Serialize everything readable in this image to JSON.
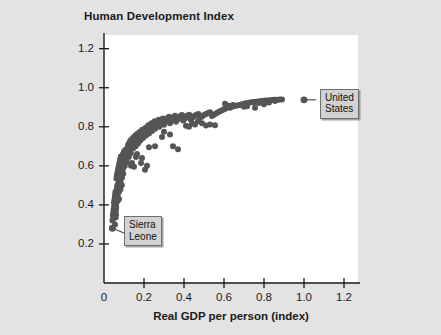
{
  "chart_data": {
    "type": "scatter",
    "title": "Human Development Index",
    "xlabel": "Real GDP per person (index)",
    "ylabel": "",
    "xlim": [
      0,
      1.27
    ],
    "ylim": [
      0,
      1.27
    ],
    "xticks": [
      "0",
      "0.2",
      "0.4",
      "0.6",
      "0.8",
      "1.0",
      "1.2"
    ],
    "xtick_values": [
      0,
      0.2,
      0.4,
      0.6,
      0.8,
      1.0,
      1.2
    ],
    "yticks": [
      "0.2",
      "0.4",
      "0.6",
      "0.8",
      "1.0",
      "1.2"
    ],
    "ytick_values": [
      0.2,
      0.4,
      0.6,
      0.8,
      1.0,
      1.2
    ],
    "grid": false,
    "legend": "none",
    "marker_color": "#555555",
    "marker_size": 6,
    "plot_background": "#ffffff",
    "figure_background": "#e3e3e3",
    "points": [
      [
        0.04,
        0.28
      ],
      [
        0.042,
        0.32
      ],
      [
        0.044,
        0.345
      ],
      [
        0.046,
        0.36
      ],
      [
        0.048,
        0.375
      ],
      [
        0.05,
        0.39
      ],
      [
        0.05,
        0.41
      ],
      [
        0.052,
        0.42
      ],
      [
        0.053,
        0.43
      ],
      [
        0.055,
        0.44
      ],
      [
        0.056,
        0.45
      ],
      [
        0.057,
        0.46
      ],
      [
        0.058,
        0.468
      ],
      [
        0.06,
        0.35
      ],
      [
        0.06,
        0.395
      ],
      [
        0.061,
        0.415
      ],
      [
        0.062,
        0.44
      ],
      [
        0.063,
        0.455
      ],
      [
        0.064,
        0.47
      ],
      [
        0.065,
        0.48
      ],
      [
        0.066,
        0.49
      ],
      [
        0.067,
        0.5
      ],
      [
        0.068,
        0.42
      ],
      [
        0.069,
        0.455
      ],
      [
        0.07,
        0.475
      ],
      [
        0.071,
        0.495
      ],
      [
        0.072,
        0.505
      ],
      [
        0.073,
        0.515
      ],
      [
        0.074,
        0.525
      ],
      [
        0.075,
        0.43
      ],
      [
        0.076,
        0.47
      ],
      [
        0.077,
        0.5
      ],
      [
        0.078,
        0.52
      ],
      [
        0.079,
        0.535
      ],
      [
        0.08,
        0.545
      ],
      [
        0.081,
        0.555
      ],
      [
        0.082,
        0.48
      ],
      [
        0.083,
        0.51
      ],
      [
        0.084,
        0.53
      ],
      [
        0.085,
        0.55
      ],
      [
        0.086,
        0.565
      ],
      [
        0.087,
        0.575
      ],
      [
        0.088,
        0.585
      ],
      [
        0.089,
        0.5
      ],
      [
        0.09,
        0.54
      ],
      [
        0.091,
        0.56
      ],
      [
        0.092,
        0.58
      ],
      [
        0.093,
        0.595
      ],
      [
        0.094,
        0.605
      ],
      [
        0.095,
        0.615
      ],
      [
        0.096,
        0.56
      ],
      [
        0.097,
        0.59
      ],
      [
        0.098,
        0.61
      ],
      [
        0.1,
        0.625
      ],
      [
        0.101,
        0.64
      ],
      [
        0.102,
        0.655
      ],
      [
        0.104,
        0.6
      ],
      [
        0.105,
        0.63
      ],
      [
        0.106,
        0.65
      ],
      [
        0.108,
        0.665
      ],
      [
        0.11,
        0.675
      ],
      [
        0.112,
        0.685
      ],
      [
        0.114,
        0.62
      ],
      [
        0.115,
        0.655
      ],
      [
        0.116,
        0.672
      ],
      [
        0.118,
        0.69
      ],
      [
        0.12,
        0.7
      ],
      [
        0.122,
        0.71
      ],
      [
        0.124,
        0.645
      ],
      [
        0.125,
        0.68
      ],
      [
        0.126,
        0.7
      ],
      [
        0.128,
        0.715
      ],
      [
        0.13,
        0.722
      ],
      [
        0.132,
        0.73
      ],
      [
        0.134,
        0.665
      ],
      [
        0.136,
        0.695
      ],
      [
        0.138,
        0.712
      ],
      [
        0.14,
        0.725
      ],
      [
        0.142,
        0.735
      ],
      [
        0.144,
        0.742
      ],
      [
        0.146,
        0.69
      ],
      [
        0.148,
        0.715
      ],
      [
        0.15,
        0.73
      ],
      [
        0.152,
        0.74
      ],
      [
        0.154,
        0.748
      ],
      [
        0.156,
        0.755
      ],
      [
        0.158,
        0.7
      ],
      [
        0.16,
        0.725
      ],
      [
        0.162,
        0.74
      ],
      [
        0.164,
        0.75
      ],
      [
        0.166,
        0.758
      ],
      [
        0.168,
        0.765
      ],
      [
        0.17,
        0.715
      ],
      [
        0.172,
        0.738
      ],
      [
        0.174,
        0.752
      ],
      [
        0.176,
        0.762
      ],
      [
        0.178,
        0.77
      ],
      [
        0.18,
        0.775
      ],
      [
        0.182,
        0.73
      ],
      [
        0.184,
        0.748
      ],
      [
        0.186,
        0.76
      ],
      [
        0.188,
        0.77
      ],
      [
        0.19,
        0.778
      ],
      [
        0.192,
        0.785
      ],
      [
        0.195,
        0.742
      ],
      [
        0.198,
        0.758
      ],
      [
        0.2,
        0.77
      ],
      [
        0.202,
        0.78
      ],
      [
        0.205,
        0.788
      ],
      [
        0.208,
        0.795
      ],
      [
        0.21,
        0.755
      ],
      [
        0.212,
        0.772
      ],
      [
        0.215,
        0.782
      ],
      [
        0.218,
        0.792
      ],
      [
        0.22,
        0.8
      ],
      [
        0.222,
        0.808
      ],
      [
        0.225,
        0.765
      ],
      [
        0.228,
        0.782
      ],
      [
        0.23,
        0.795
      ],
      [
        0.232,
        0.805
      ],
      [
        0.235,
        0.812
      ],
      [
        0.238,
        0.818
      ],
      [
        0.24,
        0.778
      ],
      [
        0.243,
        0.792
      ],
      [
        0.245,
        0.802
      ],
      [
        0.248,
        0.812
      ],
      [
        0.25,
        0.82
      ],
      [
        0.253,
        0.828
      ],
      [
        0.256,
        0.79
      ],
      [
        0.26,
        0.805
      ],
      [
        0.263,
        0.815
      ],
      [
        0.266,
        0.822
      ],
      [
        0.27,
        0.83
      ],
      [
        0.273,
        0.836
      ],
      [
        0.276,
        0.8
      ],
      [
        0.28,
        0.812
      ],
      [
        0.283,
        0.822
      ],
      [
        0.287,
        0.83
      ],
      [
        0.29,
        0.838
      ],
      [
        0.295,
        0.843
      ],
      [
        0.3,
        0.81
      ],
      [
        0.305,
        0.822
      ],
      [
        0.31,
        0.832
      ],
      [
        0.315,
        0.84
      ],
      [
        0.32,
        0.846
      ],
      [
        0.325,
        0.851
      ],
      [
        0.33,
        0.818
      ],
      [
        0.335,
        0.83
      ],
      [
        0.34,
        0.838
      ],
      [
        0.345,
        0.845
      ],
      [
        0.35,
        0.851
      ],
      [
        0.355,
        0.856
      ],
      [
        0.36,
        0.826
      ],
      [
        0.366,
        0.836
      ],
      [
        0.372,
        0.843
      ],
      [
        0.378,
        0.85
      ],
      [
        0.384,
        0.856
      ],
      [
        0.39,
        0.86
      ],
      [
        0.396,
        0.832
      ],
      [
        0.402,
        0.841
      ],
      [
        0.408,
        0.848
      ],
      [
        0.414,
        0.854
      ],
      [
        0.42,
        0.858
      ],
      [
        0.426,
        0.862
      ],
      [
        0.432,
        0.838
      ],
      [
        0.44,
        0.845
      ],
      [
        0.448,
        0.852
      ],
      [
        0.456,
        0.858
      ],
      [
        0.464,
        0.862
      ],
      [
        0.472,
        0.866
      ],
      [
        0.48,
        0.846
      ],
      [
        0.49,
        0.853
      ],
      [
        0.5,
        0.86
      ],
      [
        0.51,
        0.866
      ],
      [
        0.52,
        0.87
      ],
      [
        0.53,
        0.874
      ],
      [
        0.54,
        0.855
      ],
      [
        0.55,
        0.862
      ],
      [
        0.56,
        0.868
      ],
      [
        0.57,
        0.875
      ],
      [
        0.58,
        0.88
      ],
      [
        0.59,
        0.885
      ],
      [
        0.6,
        0.89
      ],
      [
        0.61,
        0.895
      ],
      [
        0.62,
        0.9
      ],
      [
        0.63,
        0.898
      ],
      [
        0.64,
        0.903
      ],
      [
        0.65,
        0.906
      ],
      [
        0.66,
        0.908
      ],
      [
        0.67,
        0.91
      ],
      [
        0.68,
        0.912
      ],
      [
        0.69,
        0.915
      ],
      [
        0.7,
        0.918
      ],
      [
        0.71,
        0.92
      ],
      [
        0.72,
        0.922
      ],
      [
        0.73,
        0.924
      ],
      [
        0.74,
        0.925
      ],
      [
        0.75,
        0.927
      ],
      [
        0.76,
        0.928
      ],
      [
        0.77,
        0.93
      ],
      [
        0.78,
        0.931
      ],
      [
        0.79,
        0.932
      ],
      [
        0.8,
        0.933
      ],
      [
        0.81,
        0.934
      ],
      [
        0.82,
        0.935
      ],
      [
        0.83,
        0.936
      ],
      [
        0.84,
        0.937
      ],
      [
        0.85,
        0.938
      ],
      [
        0.86,
        0.938
      ],
      [
        0.87,
        0.939
      ],
      [
        0.88,
        0.94
      ],
      [
        0.89,
        0.94
      ],
      [
        0.135,
        0.6
      ],
      [
        0.14,
        0.615
      ],
      [
        0.15,
        0.595
      ],
      [
        0.16,
        0.645
      ],
      [
        0.165,
        0.66
      ],
      [
        0.185,
        0.615
      ],
      [
        0.19,
        0.64
      ],
      [
        0.205,
        0.58
      ],
      [
        0.215,
        0.6
      ],
      [
        0.225,
        0.695
      ],
      [
        0.255,
        0.7
      ],
      [
        0.29,
        0.748
      ],
      [
        0.3,
        0.775
      ],
      [
        0.33,
        0.76
      ],
      [
        0.345,
        0.7
      ],
      [
        0.37,
        0.685
      ],
      [
        0.395,
        0.855
      ],
      [
        0.41,
        0.805
      ],
      [
        0.425,
        0.8
      ],
      [
        0.44,
        0.818
      ],
      [
        0.455,
        0.812
      ],
      [
        0.47,
        0.828
      ],
      [
        0.49,
        0.818
      ],
      [
        0.51,
        0.806
      ],
      [
        0.53,
        0.812
      ],
      [
        0.555,
        0.808
      ],
      [
        0.605,
        0.918
      ],
      [
        0.625,
        0.908
      ],
      [
        0.645,
        0.912
      ],
      [
        0.7,
        0.902
      ],
      [
        0.715,
        0.905
      ],
      [
        0.755,
        0.898
      ],
      [
        0.775,
        0.922
      ],
      [
        0.8,
        0.915
      ],
      [
        0.825,
        0.924
      ],
      [
        0.855,
        0.932
      ],
      [
        0.095,
        0.66
      ],
      [
        0.1,
        0.672
      ],
      [
        0.105,
        0.68
      ],
      [
        0.11,
        0.665
      ],
      [
        0.118,
        0.655
      ],
      [
        0.122,
        0.672
      ],
      [
        0.128,
        0.682
      ],
      [
        0.133,
        0.69
      ],
      [
        0.138,
        0.698
      ],
      [
        0.143,
        0.705
      ],
      [
        0.148,
        0.7
      ],
      [
        0.153,
        0.708
      ],
      [
        0.062,
        0.535
      ],
      [
        0.064,
        0.548
      ],
      [
        0.066,
        0.558
      ],
      [
        0.068,
        0.568
      ],
      [
        0.07,
        0.578
      ],
      [
        0.072,
        0.588
      ],
      [
        0.074,
        0.598
      ],
      [
        0.076,
        0.608
      ],
      [
        0.078,
        0.618
      ],
      [
        0.08,
        0.628
      ],
      [
        0.082,
        0.638
      ],
      [
        0.084,
        0.648
      ],
      [
        0.055,
        0.3
      ],
      [
        0.058,
        0.335
      ],
      [
        0.059,
        0.37
      ],
      [
        0.061,
        0.385
      ]
    ],
    "annotations": [
      {
        "id": "united-states",
        "label_line1": "United",
        "label_line2": "States",
        "point": [
          1.0,
          0.938
        ],
        "box_x": 1.06,
        "box_y": 1.02
      },
      {
        "id": "sierra-leone",
        "label_line1": "Sierra",
        "label_line2": "Leone",
        "point": [
          0.042,
          0.28
        ],
        "box_x": 0.12,
        "box_y": 0.355
      }
    ]
  }
}
